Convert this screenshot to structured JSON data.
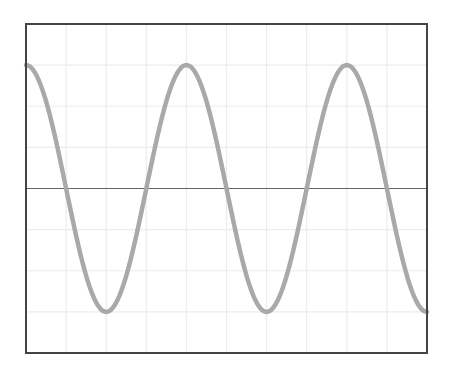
{
  "chart_data": {
    "type": "line",
    "title": "",
    "xlabel": "",
    "ylabel": "",
    "grid": true,
    "x_divisions": 10,
    "y_divisions": 8,
    "xlim": [
      0,
      10
    ],
    "ylim": [
      -4,
      4
    ],
    "series": [
      {
        "name": "cosine waveform",
        "function": "3*cos(2*pi*x/4)",
        "amplitude_divisions": 3,
        "period_divisions": 4,
        "x": [
          0,
          1,
          2,
          3,
          4,
          5,
          6,
          7,
          8,
          9,
          10
        ],
        "values": [
          3,
          0,
          -3,
          0,
          3,
          0,
          -3,
          0,
          3,
          0,
          -3
        ],
        "color": "#a9a9a9"
      }
    ],
    "reference_line": {
      "y": 0,
      "color": "#666666"
    },
    "colors": {
      "frame": "#444444",
      "grid": "#ececec",
      "background": "#ffffff"
    }
  }
}
